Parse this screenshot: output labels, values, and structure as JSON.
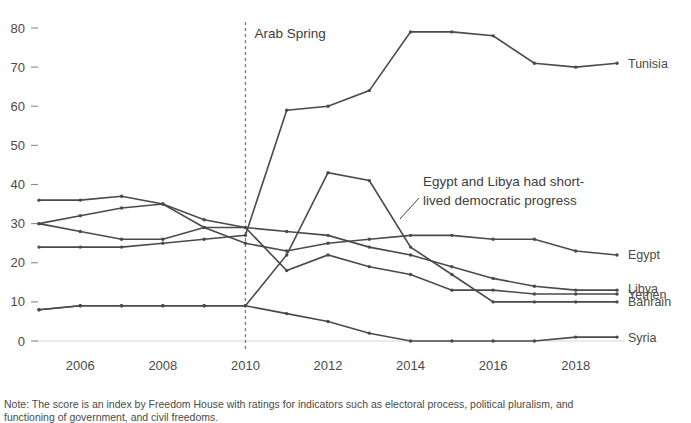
{
  "chart_data": {
    "type": "line",
    "title": "",
    "xlabel": "",
    "ylabel": "",
    "x": [
      2005,
      2006,
      2007,
      2008,
      2009,
      2010,
      2011,
      2012,
      2013,
      2014,
      2015,
      2016,
      2017,
      2018,
      2019
    ],
    "xlim": [
      2005,
      2019
    ],
    "ylim": [
      0,
      80
    ],
    "yticks": [
      0,
      10,
      20,
      30,
      40,
      50,
      60,
      70,
      80
    ],
    "xticks": [
      2006,
      2008,
      2010,
      2012,
      2014,
      2016,
      2018
    ],
    "grid": false,
    "legend_position": "right-inline-labels",
    "series": [
      {
        "name": "Tunisia",
        "values": [
          24,
          24,
          24,
          25,
          26,
          27,
          59,
          60,
          64,
          79,
          79,
          78,
          71,
          70,
          71
        ]
      },
      {
        "name": "Egypt",
        "values": [
          30,
          32,
          34,
          35,
          29,
          25,
          23,
          25,
          26,
          27,
          27,
          26,
          26,
          23,
          22
        ]
      },
      {
        "name": "Bahrain",
        "values": [
          36,
          36,
          37,
          35,
          31,
          29,
          28,
          27,
          24,
          22,
          19,
          16,
          14,
          13,
          13
        ]
      },
      {
        "name": "Yemen",
        "values": [
          30,
          28,
          26,
          26,
          29,
          29,
          18,
          22,
          19,
          17,
          13,
          13,
          12,
          12,
          12
        ]
      },
      {
        "name": "Libya",
        "values": [
          8,
          9,
          9,
          9,
          9,
          9,
          22,
          43,
          41,
          24,
          17,
          10,
          10,
          10,
          10
        ]
      },
      {
        "name": "Syria",
        "values": [
          8,
          9,
          9,
          9,
          9,
          9,
          7,
          5,
          2,
          0,
          0,
          0,
          0,
          1,
          1
        ]
      }
    ],
    "event_marker": {
      "label": "Arab Spring",
      "x": 2010
    },
    "annotation": {
      "line1": "Egypt and Libya had short-",
      "line2": "lived democratic progress",
      "target_x": 2013,
      "target_y": 26
    }
  },
  "note": {
    "line1": "Note: The score is an index by Freedom House with ratings for indicators such as electoral process, political pluralism, and",
    "line2": "functioning of government, and civil freedoms."
  },
  "colors": {
    "line": "#4a4a4a",
    "text": "#3a3a3a",
    "event": "#7a7a7a",
    "baseline": "#d6d6d6"
  }
}
